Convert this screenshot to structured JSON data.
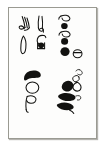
{
  "image": {
    "kind": "scanned-card",
    "description": "Small white card with thin gray border containing four clusters of hand-drawn abstract black glyph marks",
    "background_color": "#ffffff",
    "card_color": "#fdfdfc",
    "border_color": "#9a9a92",
    "ink_color": "#121210",
    "shadow_color": "#78766e"
  },
  "card": {
    "label": "glyph-card",
    "clusters": [
      {
        "id": "top-left",
        "name": "glyph-cluster-top-left",
        "marks": [
          {
            "name": "curled-hook-glyph",
            "style": "outline",
            "note": "hooked curl with tail, upper left"
          },
          {
            "name": "curled-hook-glyph",
            "style": "outline",
            "note": "hooked curl with tail, upper right"
          },
          {
            "name": "leaf-oval-glyph",
            "style": "outline",
            "note": "elongated pointed oval, lower left"
          },
          {
            "name": "ring-with-dot-glyph",
            "style": "outline-and-filled",
            "note": "small ring with solid dot, lower right"
          }
        ]
      },
      {
        "id": "top-right",
        "name": "glyph-cluster-top-right",
        "marks": [
          {
            "name": "comma-curl-glyph",
            "style": "outline",
            "note": "small comma curl"
          },
          {
            "name": "filled-dot-glyph",
            "style": "filled",
            "note": "solid round dot"
          },
          {
            "name": "comma-curl-glyph",
            "style": "outline",
            "note": "small comma curl"
          },
          {
            "name": "filled-dot-glyph",
            "style": "filled",
            "note": "solid round dot"
          },
          {
            "name": "filled-dot-glyph",
            "style": "filled",
            "note": "large solid round dot"
          },
          {
            "name": "open-circle-glyph",
            "style": "outline",
            "note": "open circle with short stroke"
          }
        ]
      },
      {
        "id": "bottom-left",
        "name": "glyph-cluster-bottom-left",
        "marks": [
          {
            "name": "crescent-wedge-glyph",
            "style": "filled",
            "note": "thick black crescent wedge on top"
          },
          {
            "name": "oval-outline-glyph",
            "style": "outline",
            "note": "rounded oval outline"
          },
          {
            "name": "p-hook-glyph",
            "style": "outline",
            "note": "p-shaped hooked loop with stem"
          }
        ]
      },
      {
        "id": "bottom-right",
        "name": "glyph-cluster-bottom-right",
        "marks": [
          {
            "name": "comma-curl-glyph",
            "style": "outline",
            "note": "small curl at top of diagonal"
          },
          {
            "name": "open-circle-glyph",
            "style": "outline",
            "note": "small open circle"
          },
          {
            "name": "filled-blob-glyph",
            "style": "filled",
            "note": "large solid blob"
          },
          {
            "name": "teardrop-glyph",
            "style": "outline",
            "note": "slanted teardrop"
          },
          {
            "name": "filled-blob-glyph",
            "style": "filled",
            "note": "solid slanted blob"
          },
          {
            "name": "wedge-tail-glyph",
            "style": "filled",
            "note": "solid wedge with trailing tail"
          },
          {
            "name": "hook-tail-glyph",
            "style": "outline",
            "note": "thin hooked tail stroke"
          }
        ]
      }
    ]
  }
}
